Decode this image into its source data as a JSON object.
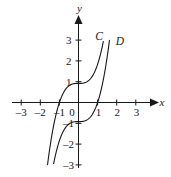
{
  "figure": {
    "background_color": "#ffffff",
    "ink_color": "#1a1a1a"
  },
  "axes": {
    "x_axis_label": "x",
    "y_axis_label": "y",
    "origin_label": "0",
    "x_ticks": [
      "–3",
      "–2",
      "–1",
      "1",
      "2",
      "3"
    ],
    "y_ticks": [
      "3",
      "2",
      "1",
      "–1",
      "–2",
      "–3"
    ]
  },
  "curves": [
    {
      "label": "C",
      "equation": "y = x^3 + 1"
    },
    {
      "label": "D",
      "equation": "y = x^3 − 1"
    }
  ],
  "chart_data": {
    "type": "line",
    "title": "",
    "xlabel": "x",
    "ylabel": "y",
    "xlim": [
      -3.4,
      3.4
    ],
    "ylim": [
      -3.4,
      3.4
    ],
    "grid": false,
    "legend": "inline-curve-labels",
    "x_tick_values": [
      -3,
      -2,
      -1,
      1,
      2,
      3
    ],
    "y_tick_values": [
      3,
      2,
      1,
      -1,
      -2,
      -3
    ],
    "series": [
      {
        "name": "C",
        "expression": "y = x^3 + 1",
        "x": [
          -1.62,
          -1.5,
          -1.35,
          -1.2,
          -1.0,
          -0.8,
          -0.6,
          -0.4,
          -0.2,
          0.0,
          0.2,
          0.4,
          0.6,
          0.8,
          1.0,
          1.2,
          1.3
        ],
        "y": [
          -3.25,
          -2.38,
          -1.46,
          -0.73,
          0.0,
          0.49,
          0.78,
          0.94,
          0.99,
          1.0,
          1.01,
          1.06,
          1.22,
          1.51,
          2.0,
          2.73,
          3.2
        ]
      },
      {
        "name": "D",
        "expression": "y = x^3 - 1",
        "x": [
          -1.3,
          -1.2,
          -1.0,
          -0.8,
          -0.6,
          -0.4,
          -0.2,
          0.0,
          0.2,
          0.4,
          0.6,
          0.8,
          1.0,
          1.2,
          1.35,
          1.5,
          1.62
        ],
        "y": [
          -3.2,
          -2.73,
          -2.0,
          -1.51,
          -1.22,
          -1.06,
          -1.01,
          -1.0,
          -0.99,
          -0.94,
          -0.78,
          -0.49,
          0.0,
          0.73,
          1.46,
          2.38,
          3.25
        ]
      }
    ]
  }
}
